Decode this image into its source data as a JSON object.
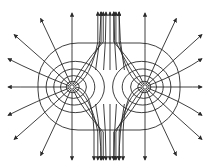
{
  "diagram": {
    "charges": [
      {
        "id": "left",
        "x": 72,
        "y": 87
      },
      {
        "id": "right",
        "x": 145,
        "y": 87
      }
    ],
    "equipotentials": {
      "inner_radii": [
        6,
        12,
        19,
        27
      ],
      "outer_contour": {
        "x": 38,
        "y": 43,
        "width": 142,
        "height": 87,
        "rx": 40
      }
    },
    "central_lines_x": [
      101,
      106,
      110,
      114,
      119
    ],
    "color": "#2a2a2a"
  }
}
